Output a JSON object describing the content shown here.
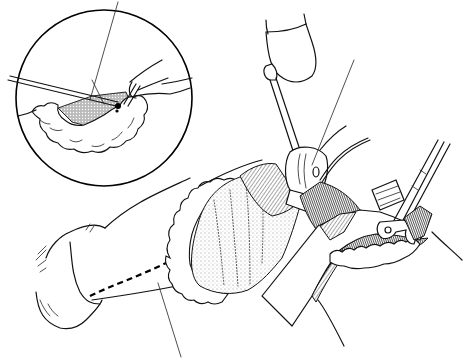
{
  "figure": {
    "kind": "surgical line illustration",
    "background": "#ffffff",
    "ink": "#111111",
    "inset": {
      "shape": "circle",
      "center": [
        104,
        98
      ],
      "radius": 88,
      "contents": [
        "omentum-lobules",
        "stippled-tissue",
        "forceps",
        "fingers",
        "probe-instrument"
      ]
    },
    "main_view": {
      "elements": [
        "surgeon-hand",
        "dashed-incision-line",
        "omentum-border",
        "stippled-organ",
        "retractor-handle",
        "malleable-retractor-blade",
        "forked-retractor",
        "wound-cavity"
      ]
    },
    "leader_lines": [
      {
        "id": "inset-top-leader",
        "from": [
          118,
          2
        ],
        "to": [
          90,
          100
        ]
      },
      {
        "id": "main-top-leader",
        "from": [
          354,
          60
        ],
        "to": [
          312,
          165
        ]
      },
      {
        "id": "bottom-leader",
        "from": [
          158,
          283
        ],
        "to": [
          181,
          357
        ]
      }
    ],
    "labels": []
  }
}
